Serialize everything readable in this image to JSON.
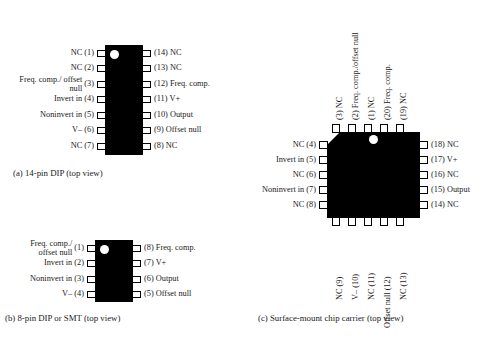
{
  "figure": {
    "packages": [
      {
        "id": "dip14",
        "caption": "(a) 14-pin DIP (top view)",
        "left_pins": [
          {
            "num": "(1)",
            "name": "NC"
          },
          {
            "num": "(2)",
            "name": "NC"
          },
          {
            "num": "(3)",
            "name": "Freq. comp./ offset null"
          },
          {
            "num": "(4)",
            "name": "Invert in"
          },
          {
            "num": "(5)",
            "name": "Noninvert in"
          },
          {
            "num": "(6)",
            "name": "V–"
          },
          {
            "num": "(7)",
            "name": "NC"
          }
        ],
        "right_pins": [
          {
            "num": "(14)",
            "name": "NC"
          },
          {
            "num": "(13)",
            "name": "NC"
          },
          {
            "num": "(12)",
            "name": "Freq. comp."
          },
          {
            "num": "(11)",
            "name": "V+"
          },
          {
            "num": "(10)",
            "name": "Output"
          },
          {
            "num": "(9)",
            "name": "Offset null"
          },
          {
            "num": "(8)",
            "name": "NC"
          }
        ]
      },
      {
        "id": "dip8",
        "caption": "(b) 8-pin DIP or SMT (top view)",
        "left_pins": [
          {
            "num": "(1)",
            "name": "Freq. comp./ offset null"
          },
          {
            "num": "(2)",
            "name": "Invert in"
          },
          {
            "num": "(3)",
            "name": "Noninvert in"
          },
          {
            "num": "(4)",
            "name": "V–"
          }
        ],
        "right_pins": [
          {
            "num": "(8)",
            "name": "Freq. comp."
          },
          {
            "num": "(7)",
            "name": "V+"
          },
          {
            "num": "(6)",
            "name": "Output"
          },
          {
            "num": "(5)",
            "name": "Offset null"
          }
        ]
      },
      {
        "id": "carrier",
        "caption": "(c) Surface-mount chip carrier (top view)",
        "top_pins": [
          {
            "num": "(3)",
            "name": "NC"
          },
          {
            "num": "(2)",
            "name": "Freq. comp./offset null"
          },
          {
            "num": "(1)",
            "name": "NC"
          },
          {
            "num": "(20)",
            "name": "Freq. comp."
          },
          {
            "num": "(19)",
            "name": "NC"
          }
        ],
        "left_pins": [
          {
            "num": "(4)",
            "name": "NC"
          },
          {
            "num": "(5)",
            "name": "Invert in"
          },
          {
            "num": "(6)",
            "name": "NC"
          },
          {
            "num": "(7)",
            "name": "Noninvert in"
          },
          {
            "num": "(8)",
            "name": "NC"
          }
        ],
        "right_pins": [
          {
            "num": "(18)",
            "name": "NC"
          },
          {
            "num": "(17)",
            "name": "V+"
          },
          {
            "num": "(16)",
            "name": "NC"
          },
          {
            "num": "(15)",
            "name": "Output"
          },
          {
            "num": "(14)",
            "name": "NC"
          }
        ],
        "bottom_pins": [
          {
            "num": "(9)",
            "name": "NC"
          },
          {
            "num": "(10)",
            "name": "V–"
          },
          {
            "num": "(11)",
            "name": "NC"
          },
          {
            "num": "(12)",
            "name": "Offset null"
          },
          {
            "num": "(13)",
            "name": "NC"
          }
        ]
      }
    ],
    "colors": {
      "body": "#000000",
      "background": "#ffffff",
      "pin_outline": "#000000",
      "text": "#1a1a1a"
    }
  }
}
